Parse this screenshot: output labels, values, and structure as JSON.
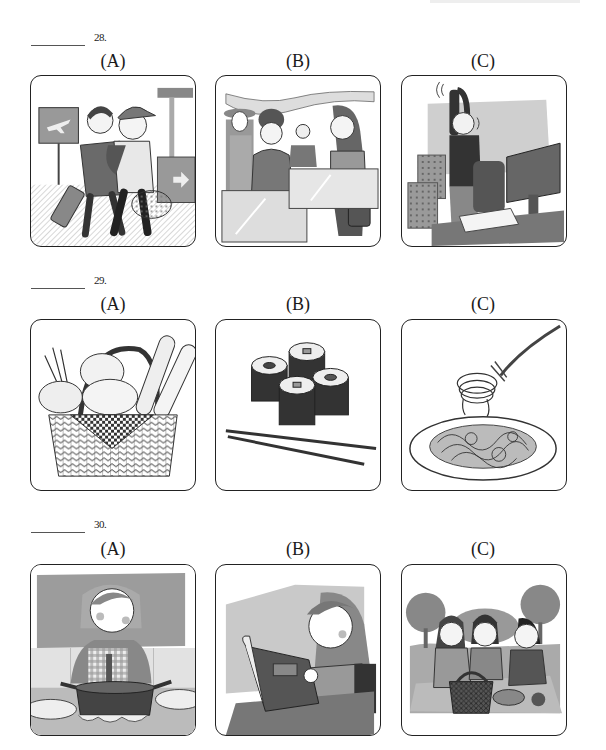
{
  "questions": [
    {
      "number": "28.",
      "options": [
        {
          "label": "(A)",
          "image": "travelers-walking-airport-icon",
          "description": "Two travelers with backpacks and luggage walking in an airport"
        },
        {
          "label": "(B)",
          "image": "shopping-department-store-icon",
          "description": "Women shopping at a store counter"
        },
        {
          "label": "(C)",
          "image": "office-stretching-icon",
          "description": "Office worker stretching at desk next to computer"
        }
      ]
    },
    {
      "number": "29.",
      "options": [
        {
          "label": "(A)",
          "image": "bread-basket-icon",
          "description": "Basket of bread and baguettes"
        },
        {
          "label": "(B)",
          "image": "sushi-chopsticks-icon",
          "description": "Sushi rolls with chopsticks"
        },
        {
          "label": "(C)",
          "image": "spaghetti-fork-icon",
          "description": "Plate of spaghetti with fork"
        }
      ]
    },
    {
      "number": "30.",
      "options": [
        {
          "label": "(A)",
          "image": "girl-cooking-icon",
          "description": "Girl stirring a pot on the stove"
        },
        {
          "label": "(B)",
          "image": "woman-reading-menu-icon",
          "description": "Woman reading a menu or book"
        },
        {
          "label": "(C)",
          "image": "picnic-friends-icon",
          "description": "Three friends having a picnic in the park"
        }
      ]
    }
  ]
}
